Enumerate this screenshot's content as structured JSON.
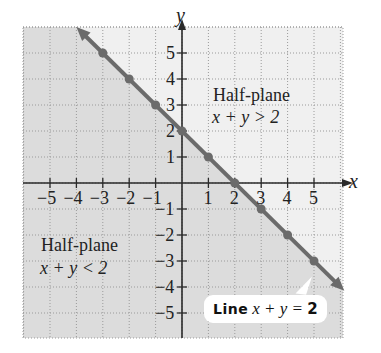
{
  "chart_data": {
    "type": "line",
    "title": "",
    "xlabel": "x",
    "ylabel": "y",
    "xlim": [
      -6,
      6
    ],
    "ylim": [
      -6,
      6
    ],
    "grid": true,
    "x_ticks": [
      -5,
      -4,
      -3,
      -2,
      -1,
      1,
      2,
      3,
      4,
      5
    ],
    "y_ticks": [
      -5,
      -4,
      -3,
      -2,
      -1,
      1,
      2,
      3,
      4,
      5
    ],
    "series": [
      {
        "name": "Line x + y = 2",
        "equation": "x + y = 2",
        "points": [
          {
            "x": -3,
            "y": 5
          },
          {
            "x": -2,
            "y": 4
          },
          {
            "x": -1,
            "y": 3
          },
          {
            "x": 0,
            "y": 2
          },
          {
            "x": 1,
            "y": 1
          },
          {
            "x": 2,
            "y": 0
          },
          {
            "x": 3,
            "y": -1
          },
          {
            "x": 4,
            "y": -2
          },
          {
            "x": 5,
            "y": -3
          }
        ],
        "arrows_both_ends": true
      }
    ],
    "regions": [
      {
        "name": "Half-plane",
        "inequality": "x + y > 2",
        "shading": "light"
      },
      {
        "name": "Half-plane",
        "inequality": "x + y < 2",
        "shading": "darker"
      }
    ],
    "annotations": [
      {
        "text": "Half-plane",
        "subtext": "x + y > 2"
      },
      {
        "text": "Half-plane",
        "subtext": "x + y < 2"
      },
      {
        "text": "Line x + y = 2"
      }
    ]
  },
  "labels": {
    "x_axis": "x",
    "y_axis": "y",
    "upper_region_title": "Half-plane",
    "upper_region_ineq": "x + y > 2",
    "lower_region_title": "Half-plane",
    "lower_region_ineq": "x + y < 2",
    "callout_word": "Line",
    "callout_eq": "x + y = ",
    "callout_num": "2"
  },
  "colors": {
    "upper_fill": "#f0f0f0",
    "lower_fill": "#dcdcdc",
    "line": "#6b6b6b",
    "axis": "#2a2a2a",
    "grid": "#9a9a9a"
  }
}
